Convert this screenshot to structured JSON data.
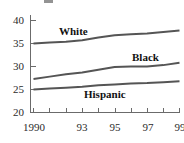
{
  "chart_data": {
    "type": "line",
    "title": "",
    "subtitle": "",
    "xlabel": "",
    "ylabel": "",
    "x": [
      1990,
      1991,
      1992,
      1993,
      1994,
      1995,
      1996,
      1997,
      1998,
      1999
    ],
    "xlim": [
      1990,
      1999
    ],
    "ylim": [
      20,
      40
    ],
    "yticks": [
      20,
      25,
      30,
      35,
      40
    ],
    "xticks": [
      1990,
      1991,
      1992,
      1993,
      1994,
      1995,
      1996,
      1997,
      1998,
      1999
    ],
    "xtick_labels": [
      "1990",
      "",
      "",
      "93",
      "",
      "95",
      "",
      "97",
      "",
      "99"
    ],
    "grid": false,
    "legend": "inline-labels",
    "series": [
      {
        "name": "White",
        "values": [
          35.0,
          35.2,
          35.4,
          35.7,
          36.3,
          36.8,
          37.0,
          37.2,
          37.5,
          37.8
        ]
      },
      {
        "name": "Black",
        "values": [
          27.3,
          27.8,
          28.3,
          28.7,
          29.3,
          29.9,
          30.0,
          30.0,
          30.3,
          30.8
        ]
      },
      {
        "name": "Hispanic",
        "values": [
          25.0,
          25.2,
          25.4,
          25.6,
          25.9,
          26.1,
          26.3,
          26.4,
          26.6,
          26.8
        ]
      }
    ]
  },
  "axis": {
    "y_labels": [
      "40",
      "35",
      "30",
      "25",
      "20"
    ],
    "x_labels": [
      "1990",
      "93",
      "95",
      "97",
      "99"
    ]
  },
  "series_labels": {
    "white": "White",
    "black": "Black",
    "hispanic": "Hispanic"
  },
  "colors": {
    "line": "#555555",
    "axis": "#6b6b6b",
    "text": "#2b2b2b",
    "label_text": "#111111",
    "background": "#ffffff"
  }
}
